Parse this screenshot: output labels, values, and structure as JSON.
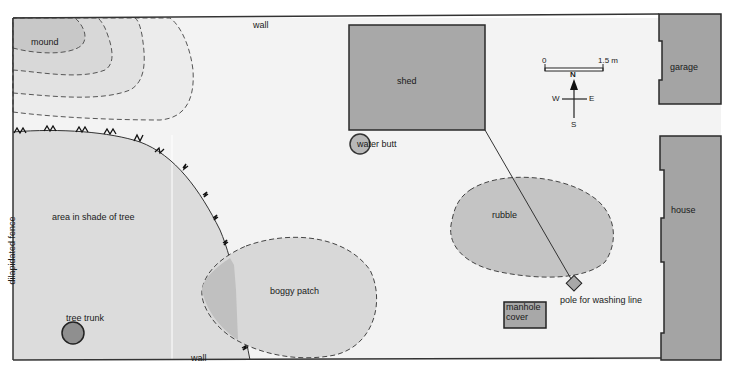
{
  "map": {
    "scale": {
      "start": "0",
      "end": "1.5 m"
    },
    "compass": {
      "n": "N",
      "s": "S",
      "e": "E",
      "w": "W"
    },
    "labels": {
      "wall_top": "wall",
      "wall_bottom": "wall",
      "mound": "mound",
      "shed": "shed",
      "water_butt": "water butt",
      "garage": "garage",
      "house": "house",
      "area_shade": "area in shade of tree",
      "fence": "dilapidated fence",
      "tree_trunk": "tree trunk",
      "boggy_patch": "boggy patch",
      "rubble": "rubble",
      "pole": "pole for washing line",
      "manhole_line1": "manhole",
      "manhole_line2": "cover"
    },
    "colors": {
      "background": "#f3f3f3",
      "light_fill": "#dcdcdc",
      "mid_fill": "#c8c8c8",
      "dark_fill": "#a4a4a4",
      "outline": "#2a2a2a"
    }
  }
}
